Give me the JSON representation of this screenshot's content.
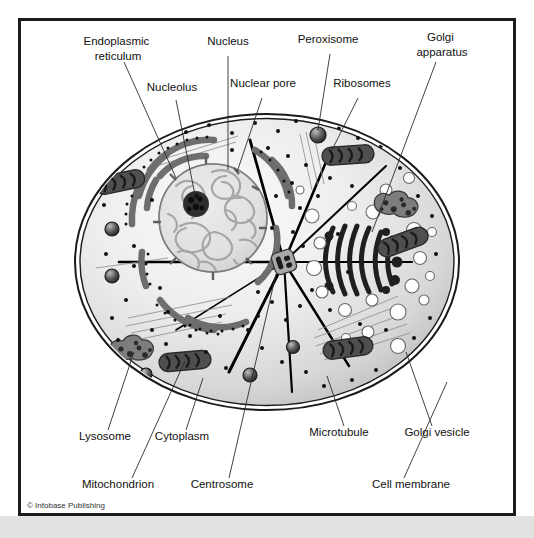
{
  "figure": {
    "copyright": "© Infobase Publishing",
    "background_color": "#ffffff",
    "frame_color": "#1b1b1b",
    "bottom_strip_color": "#e2e2e2"
  },
  "palette": {
    "cytoplasm_light": "#f2f2f2",
    "cytoplasm_mid": "#d9d9d9",
    "cytoplasm_shadow": "#bdbdbd",
    "membrane_stroke": "#1b1b1b",
    "nucleus_fill": "#e3e3e3",
    "chromatin": "#9a9a9a",
    "nucleolus": "#2a2a2a",
    "er_gray": "#6e6e6e",
    "golgi_dark": "#1f1f1f",
    "mitochondrion": "#4a4a4a",
    "lysosome": "#7a7a7a",
    "vesicle_white": "#ffffff",
    "ribosome_dot": "#111111",
    "microtubule": "#000000",
    "leader_line": "#2b2b2b",
    "label_text": "#111111"
  },
  "labels": [
    {
      "id": "endoplasmic-reticulum",
      "lines": [
        "Endoplasmic",
        "reticulum"
      ],
      "x": 118,
      "y": 45,
      "anchor": "middle"
    },
    {
      "id": "nucleus",
      "lines": [
        "Nucleus"
      ],
      "x": 228,
      "y": 45,
      "anchor": "middle"
    },
    {
      "id": "peroxisome",
      "lines": [
        "Peroxisome"
      ],
      "x": 328,
      "y": 43,
      "anchor": "middle"
    },
    {
      "id": "golgi-apparatus",
      "lines": [
        "Golgi",
        "apparatus"
      ],
      "x": 442,
      "y": 41,
      "anchor": "middle"
    },
    {
      "id": "nucleolus",
      "lines": [
        "Nucleolus"
      ],
      "x": 172,
      "y": 91,
      "anchor": "middle"
    },
    {
      "id": "nuclear-pore",
      "lines": [
        "Nuclear pore"
      ],
      "x": 263,
      "y": 87,
      "anchor": "middle"
    },
    {
      "id": "ribosomes",
      "lines": [
        "Ribosomes"
      ],
      "x": 362,
      "y": 87,
      "anchor": "middle"
    },
    {
      "id": "lysosome",
      "lines": [
        "Lysosome"
      ],
      "x": 105,
      "y": 440,
      "anchor": "middle"
    },
    {
      "id": "cytoplasm",
      "lines": [
        "Cytoplasm"
      ],
      "x": 182,
      "y": 440,
      "anchor": "middle"
    },
    {
      "id": "microtubule",
      "lines": [
        "Microtubule"
      ],
      "x": 339,
      "y": 436,
      "anchor": "middle"
    },
    {
      "id": "golgi-vesicle",
      "lines": [
        "Golgi vesicle"
      ],
      "x": 437,
      "y": 436,
      "anchor": "middle"
    },
    {
      "id": "mitochondrion",
      "lines": [
        "Mitochondrion"
      ],
      "x": 118,
      "y": 488,
      "anchor": "middle"
    },
    {
      "id": "centrosome",
      "lines": [
        "Centrosome"
      ],
      "x": 222,
      "y": 488,
      "anchor": "middle"
    },
    {
      "id": "cell-membrane",
      "lines": [
        "Cell membrane"
      ],
      "x": 411,
      "y": 488,
      "anchor": "middle"
    }
  ],
  "leader_lines": [
    {
      "id": "leader-endoplasmic-reticulum",
      "from": [
        124,
        62
      ],
      "to": [
        176,
        178
      ]
    },
    {
      "id": "leader-nucleus",
      "from": [
        228,
        56
      ],
      "to": [
        228,
        170
      ]
    },
    {
      "id": "leader-peroxisome",
      "from": [
        330,
        54
      ],
      "to": [
        318,
        135
      ]
    },
    {
      "id": "leader-golgi-apparatus",
      "from": [
        436,
        62
      ],
      "to": [
        372,
        232
      ]
    },
    {
      "id": "leader-nucleolus",
      "from": [
        176,
        100
      ],
      "to": [
        196,
        200
      ]
    },
    {
      "id": "leader-nuclear-pore",
      "from": [
        262,
        98
      ],
      "to": [
        237,
        172
      ]
    },
    {
      "id": "leader-ribosomes",
      "from": [
        358,
        98
      ],
      "to": [
        331,
        152
      ]
    },
    {
      "id": "leader-lysosome",
      "from": [
        108,
        430
      ],
      "to": [
        134,
        352
      ]
    },
    {
      "id": "leader-cytoplasm",
      "from": [
        186,
        430
      ],
      "to": [
        203,
        378
      ]
    },
    {
      "id": "leader-microtubule",
      "from": [
        344,
        426
      ],
      "to": [
        327,
        376
      ]
    },
    {
      "id": "leader-golgi-vesicle",
      "from": [
        432,
        426
      ],
      "to": [
        406,
        352
      ]
    },
    {
      "id": "leader-mitochondrion",
      "from": [
        132,
        478
      ],
      "to": [
        185,
        361
      ]
    },
    {
      "id": "leader-centrosome",
      "from": [
        229,
        478
      ],
      "to": [
        276,
        274
      ]
    },
    {
      "id": "leader-cell-membrane",
      "from": [
        404,
        478
      ],
      "to": [
        447,
        382
      ]
    }
  ],
  "structures": {
    "cell_membrane": {
      "name": "cell-membrane",
      "cx": 267,
      "cy": 262,
      "rx": 192,
      "ry": 148
    },
    "nucleus": {
      "name": "nucleus",
      "cx": 213,
      "cy": 218,
      "r": 54
    },
    "nucleolus": {
      "name": "nucleolus",
      "cx": 196,
      "cy": 204,
      "r": 13
    },
    "centrosome": {
      "name": "centrosome",
      "x": 274,
      "y": 252,
      "w": 22,
      "h": 22
    },
    "golgi_apparatus": {
      "name": "golgi-apparatus",
      "cx": 362,
      "cy": 258,
      "cisternae": 6
    },
    "counts": {
      "mitochondria": 5,
      "lysosomes": 2,
      "peroxisomes": 1,
      "golgi_vesicles": 22,
      "ribosome_dots": 64,
      "microtubules": 9,
      "er_cisternae": 9
    }
  }
}
